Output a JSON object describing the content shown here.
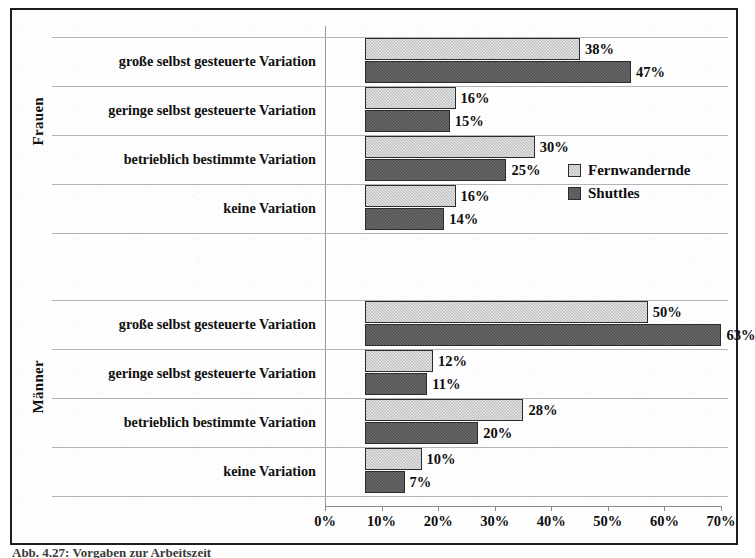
{
  "chart_data": {
    "type": "bar",
    "orientation": "horizontal",
    "title": "",
    "xlabel": "",
    "ylabel": "",
    "xlim": [
      0,
      70
    ],
    "xtick_labels": [
      "0%",
      "10%",
      "20%",
      "30%",
      "40%",
      "50%",
      "60%",
      "70%"
    ],
    "xticks": [
      0,
      10,
      20,
      30,
      40,
      50,
      60,
      70
    ],
    "grid": false,
    "legend_position": "center-right",
    "value_suffix": "%",
    "series": [
      {
        "name": "Fernwandernde",
        "color": "#b9b9b9"
      },
      {
        "name": "Shuttles",
        "color": "#4b4b4b"
      }
    ],
    "groups": [
      {
        "name": "Frauen",
        "categories": [
          "große selbst gesteuerte Variation",
          "geringe selbst gesteuerte Variation",
          "betrieblich bestimmte Variation",
          "keine Variation"
        ],
        "values": {
          "Fernwandernde": [
            38,
            16,
            30,
            16
          ],
          "Shuttles": [
            47,
            15,
            25,
            14
          ]
        },
        "labels": {
          "Fernwandernde": [
            "38%",
            "16%",
            "30%",
            "16%"
          ],
          "Shuttles": [
            "47%",
            "15%",
            "25%",
            "14%"
          ]
        }
      },
      {
        "name": "Männer",
        "categories": [
          "große selbst gesteuerte Variation",
          "geringe selbst gesteuerte Variation",
          "betrieblich bestimmte Variation",
          "keine Variation"
        ],
        "values": {
          "Fernwandernde": [
            50,
            12,
            28,
            10
          ],
          "Shuttles": [
            63,
            11,
            20,
            7
          ]
        },
        "labels": {
          "Fernwandernde": [
            "50%",
            "12%",
            "28%",
            "10%"
          ],
          "Shuttles": [
            "63%",
            "11%",
            "20%",
            "7%"
          ]
        }
      }
    ]
  },
  "legend": {
    "entries": [
      {
        "label": "Fernwandernde",
        "swatch": "light"
      },
      {
        "label": "Shuttles",
        "swatch": "dark"
      }
    ]
  },
  "caption": {
    "text": "Abb. 4.27: Vorgaben zur Arbeitszeit"
  }
}
